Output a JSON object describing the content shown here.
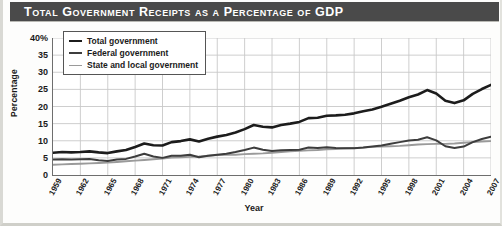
{
  "title": "Total Government Receipts as a Percentage of GDP",
  "axis": {
    "ylabel": "Percentage",
    "xlabel": "Year"
  },
  "legend": {
    "items": [
      {
        "label": "Total government",
        "color": "#1c1c1c"
      },
      {
        "label": "Federal government",
        "color": "#3d3d3d"
      },
      {
        "label": "State and local government",
        "color": "#9a9a9a"
      }
    ]
  },
  "chart_data": {
    "type": "line",
    "title": "Total Government Receipts as a Percentage of GDP",
    "xlabel": "Year",
    "ylabel": "Percentage",
    "xlim": [
      1959,
      2007
    ],
    "ylim": [
      0,
      40
    ],
    "yticks": [
      0,
      5,
      10,
      15,
      20,
      25,
      30,
      35,
      40
    ],
    "ytick_labels": [
      "0",
      "5",
      "10",
      "15",
      "20",
      "25",
      "30",
      "35",
      "40%"
    ],
    "xticks": [
      1959,
      1962,
      1965,
      1968,
      1971,
      1974,
      1977,
      1980,
      1983,
      1986,
      1989,
      1992,
      1995,
      1998,
      2001,
      2004,
      2007
    ],
    "grid": true,
    "legend_position": "upper-left",
    "x": [
      1959,
      1960,
      1961,
      1962,
      1963,
      1964,
      1965,
      1966,
      1967,
      1968,
      1969,
      1970,
      1971,
      1972,
      1973,
      1974,
      1975,
      1976,
      1977,
      1978,
      1979,
      1980,
      1981,
      1982,
      1983,
      1984,
      1985,
      1986,
      1987,
      1988,
      1989,
      1990,
      1991,
      1992,
      1993,
      1994,
      1995,
      1996,
      1997,
      1998,
      1999,
      2000,
      2001,
      2002,
      2003,
      2004,
      2005,
      2006,
      2007
    ],
    "series": [
      {
        "name": "Total government",
        "color": "#1c1c1c",
        "values": [
          6.5,
          6.7,
          6.6,
          6.7,
          6.9,
          6.6,
          6.4,
          6.9,
          7.3,
          8.2,
          9.2,
          8.7,
          8.6,
          9.6,
          9.9,
          10.4,
          9.8,
          10.6,
          11.2,
          11.7,
          12.4,
          13.4,
          14.6,
          14.1,
          13.9,
          14.6,
          15.0,
          15.5,
          16.6,
          16.7,
          17.3,
          17.4,
          17.6,
          18.0,
          18.6,
          19.1,
          19.9,
          20.8,
          21.7,
          22.7,
          23.5,
          24.8,
          23.8,
          21.7,
          21.0,
          21.8,
          23.7,
          25.1,
          26.3
        ]
      },
      {
        "name": "Federal government",
        "color": "#3d3d3d",
        "values": [
          4.5,
          4.6,
          4.5,
          4.6,
          4.7,
          4.3,
          4.1,
          4.5,
          4.7,
          5.4,
          6.2,
          5.4,
          5.0,
          5.6,
          5.6,
          5.9,
          5.2,
          5.6,
          5.9,
          6.2,
          6.7,
          7.3,
          8.0,
          7.4,
          7.0,
          7.2,
          7.3,
          7.4,
          8.0,
          7.9,
          8.1,
          7.9,
          7.8,
          7.8,
          8.0,
          8.3,
          8.6,
          9.1,
          9.6,
          10.1,
          10.3,
          11.0,
          10.1,
          8.4,
          7.9,
          8.3,
          9.6,
          10.5,
          11.2
        ]
      },
      {
        "name": "State and local government",
        "color": "#9a9a9a",
        "values": [
          3.0,
          3.1,
          3.2,
          3.3,
          3.4,
          3.5,
          3.6,
          3.8,
          4.0,
          4.2,
          4.4,
          4.6,
          4.8,
          5.1,
          5.2,
          5.3,
          5.4,
          5.6,
          5.8,
          5.9,
          5.9,
          6.1,
          6.2,
          6.3,
          6.5,
          6.7,
          6.9,
          7.1,
          7.2,
          7.3,
          7.5,
          7.6,
          7.8,
          7.9,
          8.0,
          8.2,
          8.3,
          8.4,
          8.5,
          8.7,
          8.9,
          9.0,
          9.1,
          9.1,
          9.2,
          9.4,
          9.6,
          9.8,
          9.9
        ]
      }
    ]
  }
}
